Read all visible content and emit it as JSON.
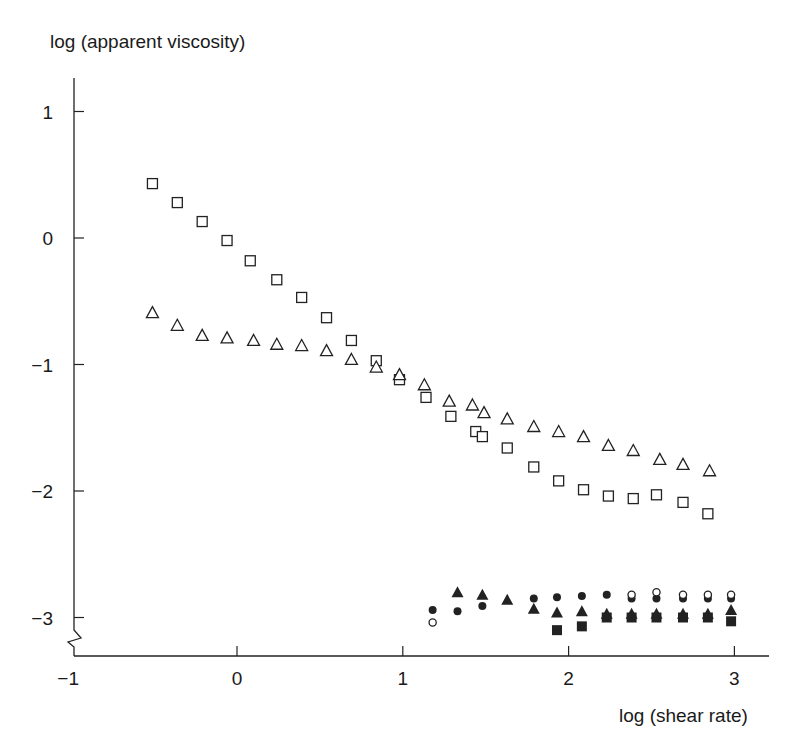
{
  "chart_data": {
    "type": "scatter",
    "title": "",
    "xlabel": "log (shear rate)",
    "ylabel": "log (apparent viscosity)",
    "xlim": [
      -1,
      3.2
    ],
    "ylim": [
      -3.3,
      1.25
    ],
    "x_ticks": [
      -1,
      0,
      1,
      2,
      3
    ],
    "x_tick_labels": [
      "−1",
      "0",
      "1",
      "2",
      "3"
    ],
    "y_ticks": [
      1,
      0,
      -1,
      -2,
      -3
    ],
    "y_tick_labels": [
      "1",
      "0",
      "−1",
      "−2",
      "−3"
    ],
    "grid": false,
    "legend": "none",
    "y_axis_break": true,
    "series": [
      {
        "name": "open squares",
        "marker": "square-open",
        "x": [
          -0.51,
          -0.36,
          -0.21,
          -0.06,
          0.08,
          0.24,
          0.39,
          0.54,
          0.69,
          0.84,
          0.98,
          1.14,
          1.29,
          1.44,
          1.48,
          1.63,
          1.79,
          1.94,
          2.09,
          2.24,
          2.39,
          2.53,
          2.69,
          2.84
        ],
        "y": [
          0.43,
          0.28,
          0.13,
          -0.02,
          -0.18,
          -0.33,
          -0.47,
          -0.63,
          -0.81,
          -0.97,
          -1.12,
          -1.26,
          -1.41,
          -1.53,
          -1.57,
          -1.66,
          -1.81,
          -1.92,
          -1.99,
          -2.04,
          -2.06,
          -2.03,
          -2.09,
          -2.18
        ]
      },
      {
        "name": "open triangles",
        "marker": "triangle-open",
        "x": [
          -0.51,
          -0.36,
          -0.21,
          -0.06,
          0.1,
          0.24,
          0.39,
          0.54,
          0.69,
          0.84,
          0.98,
          1.13,
          1.28,
          1.42,
          1.49,
          1.63,
          1.79,
          1.94,
          2.09,
          2.24,
          2.39,
          2.55,
          2.69,
          2.85
        ],
        "y": [
          -0.59,
          -0.69,
          -0.77,
          -0.79,
          -0.81,
          -0.84,
          -0.85,
          -0.89,
          -0.96,
          -1.02,
          -1.08,
          -1.16,
          -1.29,
          -1.32,
          -1.38,
          -1.43,
          -1.49,
          -1.53,
          -1.57,
          -1.64,
          -1.68,
          -1.75,
          -1.79,
          -1.84
        ]
      },
      {
        "name": "filled triangles",
        "marker": "triangle-filled",
        "x": [
          1.33,
          1.48,
          1.63,
          1.79,
          1.93,
          2.08,
          2.23,
          2.38,
          2.53,
          2.69,
          2.84,
          2.98
        ],
        "y": [
          -2.8,
          -2.82,
          -2.86,
          -2.93,
          -2.96,
          -2.95,
          -2.97,
          -2.97,
          -2.97,
          -2.97,
          -2.97,
          -2.94
        ]
      },
      {
        "name": "filled circles",
        "marker": "circle-filled",
        "x": [
          1.18,
          1.33,
          1.48,
          1.79,
          1.93,
          2.08,
          2.23,
          2.38,
          2.53,
          2.69,
          2.84,
          2.98
        ],
        "y": [
          -2.94,
          -2.95,
          -2.91,
          -2.85,
          -2.84,
          -2.83,
          -2.82,
          -2.85,
          -2.85,
          -2.85,
          -2.85,
          -2.85
        ]
      },
      {
        "name": "open circles",
        "marker": "circle-open",
        "x": [
          1.18,
          2.38,
          2.53,
          2.69,
          2.84,
          2.98
        ],
        "y": [
          -3.04,
          -2.82,
          -2.8,
          -2.82,
          -2.82,
          -2.82
        ]
      },
      {
        "name": "filled squares",
        "marker": "square-filled",
        "x": [
          1.93,
          2.08,
          2.23,
          2.38,
          2.53,
          2.69,
          2.84,
          2.98
        ],
        "y": [
          -3.1,
          -3.07,
          -3.0,
          -3.0,
          -3.0,
          -3.0,
          -3.0,
          -3.03
        ]
      }
    ]
  }
}
